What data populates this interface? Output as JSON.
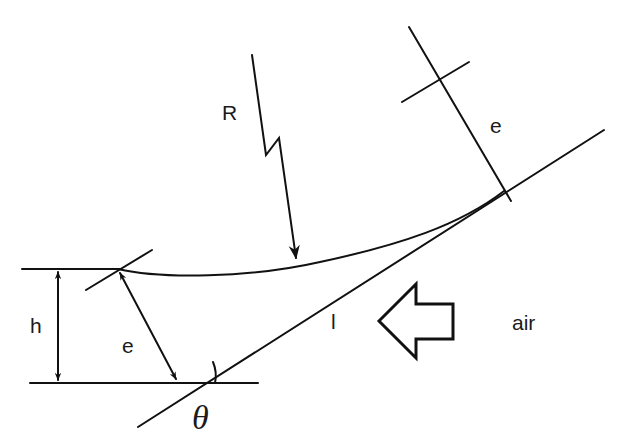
{
  "diagram": {
    "labels": {
      "R": "R",
      "e_top": "e",
      "e_left": "e",
      "h": "h",
      "l": "l",
      "air": "air",
      "theta": "θ"
    },
    "colors": {
      "line": "#111111",
      "background": "#ffffff"
    },
    "elements": [
      {
        "type": "horizontal-line",
        "name": "top-reference-line"
      },
      {
        "type": "horizontal-line",
        "name": "base-line"
      },
      {
        "type": "inclined-line",
        "name": "slope-line",
        "label": "l"
      },
      {
        "type": "curve",
        "name": "surface-curve"
      },
      {
        "type": "double-arrow",
        "name": "height-arrow",
        "label": "h"
      },
      {
        "type": "double-arrow",
        "name": "thickness-arrow",
        "label": "e"
      },
      {
        "type": "dimension-line",
        "name": "thickness-dimension-top",
        "label": "e"
      },
      {
        "type": "lightning-arrow",
        "name": "radiation-arrow",
        "label": "R"
      },
      {
        "type": "hollow-arrow",
        "name": "air-flow-arrow",
        "label": "air"
      },
      {
        "type": "angle-arc",
        "name": "slope-angle",
        "label": "θ"
      }
    ]
  }
}
